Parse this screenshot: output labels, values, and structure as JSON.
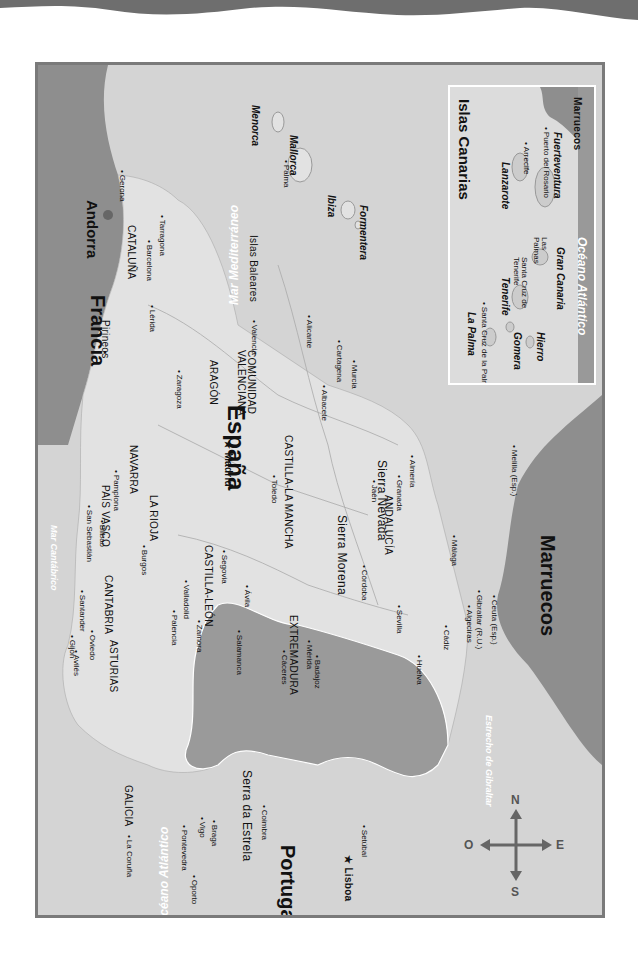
{
  "map": {
    "title": "España",
    "orientation": "rotated 90° clockwise; north to the right",
    "colors": {
      "sea": "#d4d4d4",
      "spain_land": "#e2e2e2",
      "portugal": "#9a9a9a",
      "foreign_land": "#8e8e8e",
      "frame": "#7a7a7a",
      "wave": "#6e6e6e"
    },
    "countries": {
      "spain": "España",
      "portugal": "Portugal",
      "france": "Francia",
      "andorra": "Andorra",
      "morocco": "Marruecos",
      "morocco_inset": "Marruecos"
    },
    "seas": {
      "atlantic": "Océano Atlántico",
      "mediterranean": "Mar Mediterráneo",
      "cantabrian": "Mar Cantábrico",
      "gibraltar_strait": "Estrecho de Gibraltar",
      "atlantic_inset": "Océano Atlántico"
    },
    "regions": [
      {
        "name": "GALICIA"
      },
      {
        "name": "ASTURIAS"
      },
      {
        "name": "CANTABRIA"
      },
      {
        "name": "PAÍS VASCO"
      },
      {
        "name": "NAVARRA"
      },
      {
        "name": "LA RIOJA"
      },
      {
        "name": "ARAGÓN"
      },
      {
        "name": "CATALUÑA"
      },
      {
        "name": "CASTILLA-LEÓN"
      },
      {
        "name": "CASTILLA-LA MANCHA"
      },
      {
        "name": "EXTREMADURA"
      },
      {
        "name": "ANDALUCÍA"
      },
      {
        "name": "COMUNIDAD VALENCIANA"
      }
    ],
    "mountains": [
      "Pirineos",
      "Sierra Morena",
      "Sierra Nevada",
      "Serra da Estrela"
    ],
    "capitals": {
      "madrid": "Madrid",
      "lisboa": "Lisboa"
    },
    "cities": [
      "La Coruña",
      "Pontevedra",
      "Vigo",
      "Avilés",
      "Gijón",
      "Oviedo",
      "Santander",
      "Bilbao",
      "San Sebastián",
      "Pamplona",
      "Burgos",
      "Palencia",
      "Valladolid",
      "Zamora",
      "Salamanca",
      "Ávila",
      "Segovia",
      "Zaragoza",
      "Lérida",
      "Barcelona",
      "Tarragona",
      "Gerona",
      "Valencia",
      "Alicante",
      "Albacete",
      "Murcia",
      "Cartagena",
      "Toledo",
      "Cáceres",
      "Mérida",
      "Badajoz",
      "Córdoba",
      "Sevilla",
      "Huelva",
      "Cádiz",
      "Algeciras",
      "Gibraltar (R.U.)",
      "Ceuta (Esp.)",
      "Málaga",
      "Granada",
      "Jaén",
      "Almería",
      "Melilla (Esp.)",
      "Oporto",
      "Braga",
      "Coimbra",
      "Setúbal"
    ],
    "islands": {
      "group": "Islas Baleares",
      "list": [
        "Menorca",
        "Mallorca",
        "Ibiza",
        "Formentera"
      ],
      "palma": "Palma"
    },
    "canarias": {
      "title": "Islas Canarias",
      "islands": [
        "La Palma",
        "Tenerife",
        "Gomera",
        "Hierro",
        "Gran Canaria",
        "Lanzarote",
        "Fuerteventura"
      ],
      "cities": [
        "Santa Cruz de la Palma",
        "Santa Cruz de Tenerife",
        "Las Palmas",
        "Arrecife",
        "Puerto del Rosario"
      ]
    },
    "compass": {
      "n": "N",
      "s": "S",
      "e": "E",
      "o": "O"
    }
  }
}
